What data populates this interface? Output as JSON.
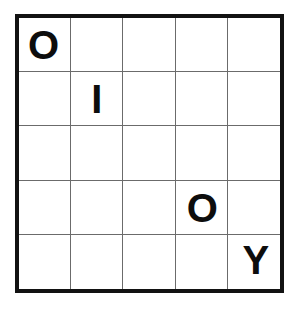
{
  "puzzle": {
    "type": "letter-grid",
    "rows": 5,
    "columns": 5,
    "background_color": "#ffffff",
    "border_color": "#121212",
    "gridline_color": "#6b6b6b",
    "letter_color": "#0d0d0d",
    "letters_sequence": "OIOY",
    "grid": [
      [
        "O",
        "",
        "",
        "",
        ""
      ],
      [
        "",
        "I",
        "",
        "",
        ""
      ],
      [
        "",
        "",
        "",
        "",
        ""
      ],
      [
        "",
        "",
        "",
        "O",
        ""
      ],
      [
        "",
        "",
        "",
        "",
        "Y"
      ]
    ],
    "filled_cells": [
      {
        "row": 1,
        "column": 1,
        "letter": "O"
      },
      {
        "row": 2,
        "column": 2,
        "letter": "I"
      },
      {
        "row": 4,
        "column": 4,
        "letter": "O"
      },
      {
        "row": 5,
        "column": 5,
        "letter": "Y"
      }
    ]
  }
}
